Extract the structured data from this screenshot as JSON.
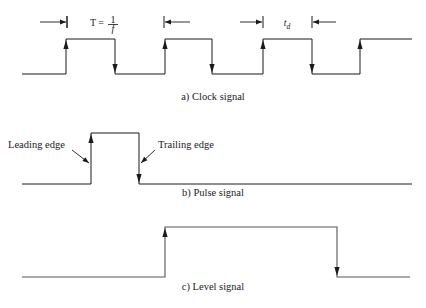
{
  "figure": {
    "title": "",
    "background": "#ffffff",
    "stroke_color": "#1a1a1a",
    "level_stroke_color": "#555555"
  },
  "chart_data": {
    "type": "line",
    "xlabel": "",
    "ylabel": "",
    "grid": false,
    "legend": "none",
    "panels": [
      {
        "id": "clock",
        "caption": "a) Clock signal",
        "caption_x": 213,
        "caption_y": 100,
        "baseline_y": 74,
        "high_y": 39,
        "x_start": 22,
        "x_end": 412,
        "transitions": [
          {
            "x": 66,
            "type": "rise"
          },
          {
            "x": 115,
            "type": "fall"
          },
          {
            "x": 165,
            "type": "rise"
          },
          {
            "x": 212,
            "type": "fall"
          },
          {
            "x": 263,
            "type": "rise"
          },
          {
            "x": 312,
            "type": "fall"
          },
          {
            "x": 360,
            "type": "rise"
          }
        ],
        "dimensions": [
          {
            "name": "pre-period-mark",
            "label": "",
            "tick_x": 67,
            "arrow_from_x": 40,
            "arrow_dir": "right",
            "y": 22
          },
          {
            "name": "period-T",
            "label_html": "T = 1/f",
            "label_lead": "T =",
            "numerator": "1",
            "denominator": "f",
            "label_x": 118,
            "label_y": 22,
            "tick_left_x": 67,
            "tick_right_x": 164,
            "arrow_right_from_x": 190,
            "arrow_dir": "left",
            "y": 22
          },
          {
            "name": "pulse-width-td",
            "label_lead": "t",
            "subscript": "d",
            "label_x": 287,
            "label_y": 22,
            "tick_left_x": 263,
            "tick_right_x": 312,
            "arrow_left_from_x": 240,
            "arrow_right_from_x": 336,
            "y": 22
          }
        ]
      },
      {
        "id": "pulse",
        "caption": "b) Pulse signal",
        "caption_x": 213,
        "caption_y": 196,
        "baseline_y": 184,
        "high_y": 133,
        "x_start": 22,
        "x_end": 412,
        "transitions": [
          {
            "x": 91,
            "type": "rise"
          },
          {
            "x": 139,
            "type": "fall"
          }
        ],
        "annotations": [
          {
            "name": "leading-edge",
            "text": "Leading edge",
            "text_x": 8,
            "text_y": 148,
            "leader_from_x": 72,
            "leader_from_y": 150,
            "leader_to_x": 89,
            "leader_to_y": 163
          },
          {
            "name": "trailing-edge",
            "text": "Trailing edge",
            "text_x": 158,
            "text_y": 148,
            "leader_from_x": 155,
            "leader_from_y": 150,
            "leader_to_x": 141,
            "leader_to_y": 163
          }
        ]
      },
      {
        "id": "level",
        "caption": "c) Level signal",
        "caption_x": 213,
        "caption_y": 290,
        "baseline_y": 277,
        "high_y": 227,
        "x_start": 22,
        "x_end": 410,
        "transitions": [
          {
            "x": 165,
            "type": "rise"
          },
          {
            "x": 337,
            "type": "fall"
          }
        ]
      }
    ]
  }
}
